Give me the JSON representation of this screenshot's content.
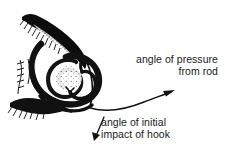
{
  "figure": {
    "background_color": "#ffffff",
    "ink_color": "#101010",
    "parts": {
      "upper_jaw": "upper-jaw-icon",
      "tongue": "tongue-icon",
      "throat": "throat-icon",
      "hook": "hook-icon",
      "leader_line": "fishing-line-icon",
      "gill_rakers": "gill-rakers-icon"
    }
  },
  "annotations": {
    "pressure": {
      "line1": "angle of pressure",
      "line2": "from rod",
      "arrow": {
        "name": "pressure-arrow",
        "from": [
          92,
          107
        ],
        "to": [
          174,
          91
        ],
        "style": "curved",
        "points_to": "direction of rod pressure along the line"
      }
    },
    "impact": {
      "line1": "angle of initial",
      "line2": "impact of hook",
      "arrow": {
        "name": "impact-arrow",
        "from": [
          104,
          117
        ],
        "to": [
          94,
          140
        ],
        "style": "straight",
        "points_to": "direction of initial hook impact"
      }
    }
  }
}
